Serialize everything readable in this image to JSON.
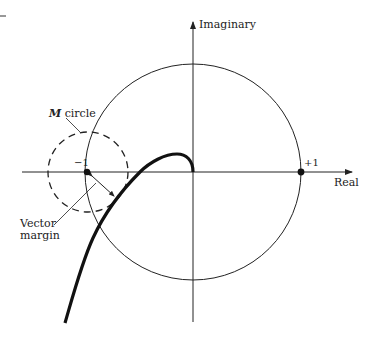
{
  "diagram": {
    "type": "nyquist-plot",
    "axes": {
      "imaginary_label": "Imaginary",
      "real_label": "Real"
    },
    "points": {
      "minus_one_label": "−1",
      "plus_one_label": "+1"
    },
    "annotations": {
      "m_circle_italic": "M",
      "m_circle_text": " circle",
      "vector_margin_line1": "Vector",
      "vector_margin_line2": "margin"
    },
    "colors": {
      "stroke": "#222222",
      "background": "#ffffff"
    }
  }
}
